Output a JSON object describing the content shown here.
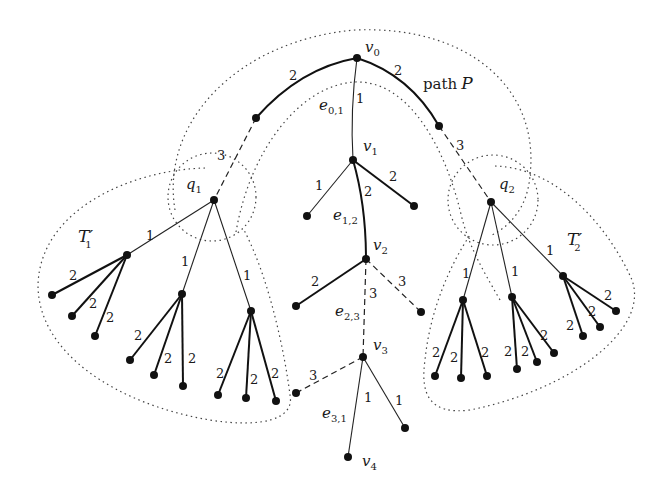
{
  "figure": {
    "vertex_labels": {
      "v0": "v",
      "v0_sub": "0",
      "v1": "v",
      "v1_sub": "1",
      "v2": "v",
      "v2_sub": "2",
      "v3": "v",
      "v3_sub": "3",
      "v4": "v",
      "v4_sub": "4",
      "q1": "q",
      "q1_sub": "1",
      "q2": "q",
      "q2_sub": "2"
    },
    "subtree_labels": {
      "t1": "T′",
      "t1_sub": "1",
      "t2": "T′",
      "t2_sub": "2"
    },
    "edge_labels": {
      "e01": "e",
      "e01_sub": "0,1",
      "e12": "e",
      "e12_sub": "1,2",
      "e23": "e",
      "e23_sub": "2,3",
      "e31": "e",
      "e31_sub": "3,1"
    },
    "path_label": "path",
    "path_var": "P",
    "weights": {
      "v0_left": "2",
      "v0_right": "2",
      "v0_v1": "1",
      "left_q1": "3",
      "right_q2": "3",
      "v1_left": "1",
      "v1_right": "2",
      "v1_v2": "2",
      "v2_left": "2",
      "v2_right": "3",
      "v2_v3": "3",
      "v3_left": "3",
      "v3_v4": "1",
      "v3_right": "1",
      "q1_a": "1",
      "q1_b": "1",
      "q1_c": "1",
      "a1": "2",
      "a2": "2",
      "a3": "2",
      "b1": "2",
      "b2": "2",
      "b3": "2",
      "c1": "2",
      "c2": "2",
      "c3": "2",
      "q2_d": "1",
      "q2_e": "1",
      "q2_f": "1",
      "d1": "2",
      "d2": "2",
      "d3": "2",
      "e1": "2",
      "e2": "2",
      "e3": "2",
      "f1": "2",
      "f2": "2",
      "f3": "2"
    },
    "legend": {
      "weight_1": "thin solid edge",
      "weight_2": "thick solid edge",
      "weight_3": "dashed edge",
      "region": "dotted boundary"
    }
  }
}
